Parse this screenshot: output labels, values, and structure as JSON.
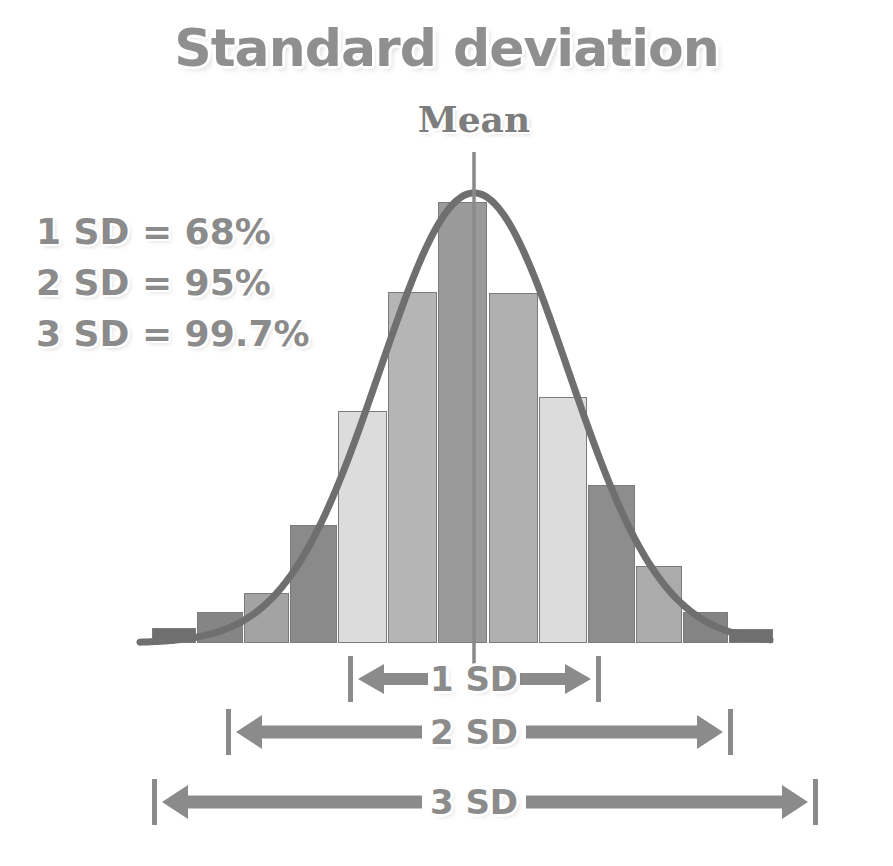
{
  "title": "Standard deviation",
  "mean_label": "Mean",
  "legend": {
    "items": [
      {
        "label": "1 SD = 68%"
      },
      {
        "label": "2 SD = 95%"
      },
      {
        "label": "3 SD = 99.7%"
      }
    ]
  },
  "sd_bands": [
    {
      "label": "1 SD",
      "left_px": 348,
      "right_px": 601,
      "row_top_px": 652
    },
    {
      "label": "2 SD",
      "left_px": 226,
      "right_px": 733,
      "row_top_px": 705
    },
    {
      "label": "3 SD",
      "left_px": 152,
      "right_px": 818,
      "row_top_px": 775
    }
  ],
  "colors": {
    "ink": "#8b8b8b",
    "curve": "#6f6f6f",
    "bar_outline": "#7b7b7b",
    "background": "#ffffff"
  },
  "chart_data": {
    "type": "bar",
    "title": "Standard deviation",
    "xlabel": "",
    "ylabel": "",
    "grid": false,
    "legend_position": "top-left",
    "annotations": [
      "Mean",
      "1 SD = 68%",
      "2 SD = 95%",
      "3 SD = 99.7%",
      "1 SD",
      "2 SD",
      "3 SD"
    ],
    "overlay_curve": {
      "type": "line",
      "name": "normal distribution curve",
      "mean_x_px": 474,
      "peak_y_px": 193,
      "baseline_y_px": 643
    },
    "x_axis": {
      "center_is_mean": true,
      "units": "standard deviations",
      "tick_labels": [
        "-3 SD",
        "-2 SD",
        "-1 SD",
        "Mean",
        "+1 SD",
        "+2 SD",
        "+3 SD"
      ]
    },
    "categories": [
      "-3.25 SD",
      "-2.75 SD",
      "-2.25 SD",
      "-1.75 SD",
      "-1.25 SD",
      "-0.75 SD",
      "-0.25 SD",
      "+0.25 SD",
      "+0.75 SD",
      "+1.25 SD",
      "+1.75 SD",
      "+2.25 SD",
      "+2.75 SD"
    ],
    "values": [
      2,
      6,
      18,
      34,
      62,
      86,
      100,
      86,
      66,
      43,
      19,
      8,
      3
    ],
    "ylim": [
      0,
      100
    ],
    "bars": [
      {
        "x_px": 152,
        "width_px": 44,
        "top_px": 628,
        "shade": "#6f6f6f"
      },
      {
        "x_px": 197,
        "width_px": 46,
        "top_px": 612,
        "shade": "#858585"
      },
      {
        "x_px": 244,
        "width_px": 45,
        "top_px": 593,
        "shade": "#a3a3a3"
      },
      {
        "x_px": 290,
        "width_px": 47,
        "top_px": 525,
        "shade": "#8a8a8a"
      },
      {
        "x_px": 338,
        "width_px": 49,
        "top_px": 411,
        "shade": "#dcdcdc"
      },
      {
        "x_px": 388,
        "width_px": 49,
        "top_px": 292,
        "shade": "#b5b5b5"
      },
      {
        "x_px": 438,
        "width_px": 49,
        "top_px": 202,
        "shade": "#9a9a9a"
      },
      {
        "x_px": 489,
        "width_px": 49,
        "top_px": 293,
        "shade": "#b0b0b0"
      },
      {
        "x_px": 539,
        "width_px": 48,
        "top_px": 397,
        "shade": "#dcdcdc"
      },
      {
        "x_px": 588,
        "width_px": 47,
        "top_px": 485,
        "shade": "#8d8d8d"
      },
      {
        "x_px": 636,
        "width_px": 46,
        "top_px": 566,
        "shade": "#ababab"
      },
      {
        "x_px": 683,
        "width_px": 45,
        "top_px": 612,
        "shade": "#848484"
      },
      {
        "x_px": 729,
        "width_px": 44,
        "top_px": 629,
        "shade": "#6f6f6f"
      }
    ]
  }
}
